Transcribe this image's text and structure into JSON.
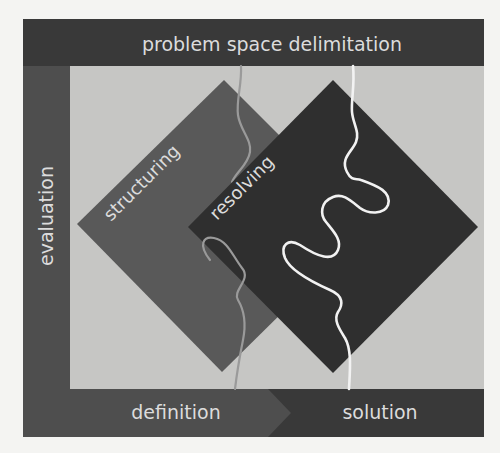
{
  "diagram": {
    "top_bar": {
      "label": "problem space delimitation"
    },
    "left_bar": {
      "label": "evaluation"
    },
    "bottom_bar": {
      "left_label": "definition",
      "right_label": "solution"
    },
    "diamonds": [
      {
        "id": "structuring",
        "label": "structuring"
      },
      {
        "id": "resolving",
        "label": "resolving"
      }
    ],
    "paths": [
      {
        "id": "structuring-path",
        "style": "gray line"
      },
      {
        "id": "resolving-path",
        "style": "white line"
      }
    ]
  },
  "colors": {
    "page_bg": "#f4f4f2",
    "inner_bg": "#c6c6c4",
    "top_bar": "#393939",
    "left_bar": "#4e4e4e",
    "definition_bar": "#4e4e4e",
    "solution_bar": "#393939",
    "structuring_diamond": "#595959",
    "resolving_diamond": "#2f2f2f",
    "structuring_path": "#9a9a9a",
    "resolving_path": "#f2f2f2",
    "text": "#dcdcdc"
  }
}
